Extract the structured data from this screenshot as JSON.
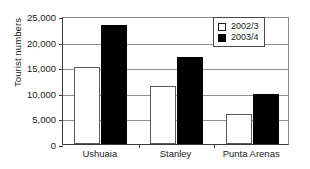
{
  "chart_data": {
    "type": "bar",
    "title": "",
    "xlabel": "",
    "ylabel": "Tourist numbers",
    "categories": [
      "Ushuaia",
      "Stanley",
      "Punta Arenas"
    ],
    "series": [
      {
        "name": "2002/3",
        "values": [
          15000,
          11300,
          5900
        ],
        "color": "#ffffff",
        "swatch": "open"
      },
      {
        "name": "2003/4",
        "values": [
          23300,
          17000,
          9700
        ],
        "color": "#000000",
        "swatch": "filled"
      }
    ],
    "ylim": [
      0,
      25000
    ],
    "yticks": [
      0,
      5000,
      10000,
      15000,
      20000,
      25000
    ],
    "ytick_labels": [
      "0",
      "5,000",
      "10,000",
      "15,000",
      "20,000",
      "25,000"
    ],
    "grid": true,
    "legend_position": "top-right"
  },
  "legend": {
    "entries": [
      {
        "label": "2002/3"
      },
      {
        "label": "2003/4"
      }
    ]
  }
}
